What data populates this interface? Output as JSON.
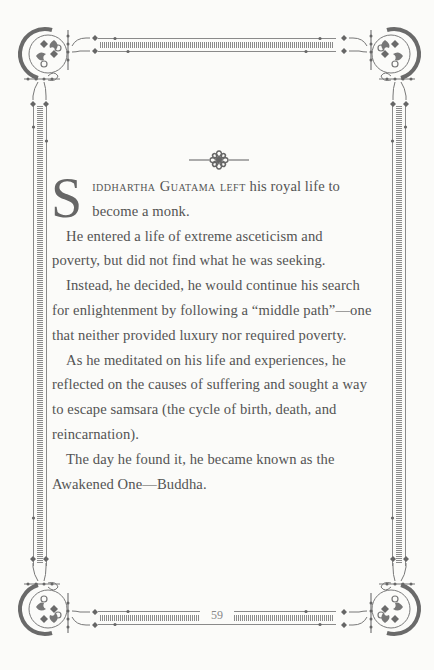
{
  "page": {
    "page_number": "59",
    "colors": {
      "background": "#fbfbf9",
      "ink": "#545454",
      "ornament": "#6a6a6a"
    }
  },
  "ornaments": {
    "fleuron": "eight-petal-flower",
    "corners": [
      "scroll-corner-top-left",
      "scroll-corner-top-right",
      "scroll-corner-bottom-left",
      "scroll-corner-bottom-right"
    ]
  },
  "article": {
    "dropcap": "S",
    "lead_smallcaps": "iddhartha Guatama left",
    "paragraphs": [
      " his royal life to become a monk.",
      "He entered a life of extreme asceticism and poverty, but did not find what he was seeking.",
      "Instead, he decided, he would continue his search for enlightenment by following a “middle path”—one that neither provided luxury nor required poverty.",
      "As he meditated on his life and experiences, he reflected on the causes of suffering and sought a way to escape samsara (the cycle of birth, death, and reincarnation).",
      "The day he found it, he became known as the Awakened One—Buddha."
    ]
  }
}
